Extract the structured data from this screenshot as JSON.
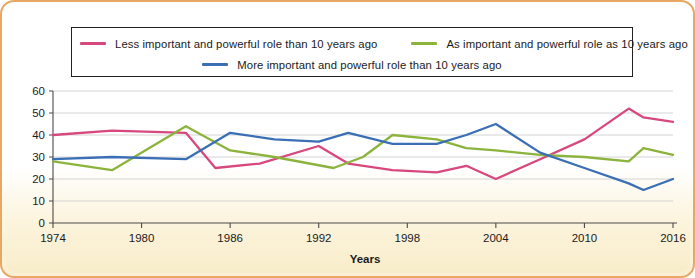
{
  "theme": {
    "border_color": "#e8a762",
    "panel_bg": "#ffffff",
    "grid_color": "#c9c9c9"
  },
  "legend": {
    "position": "top",
    "entries": [
      {
        "label": "Less important and powerful role than 10 years ago",
        "color": "#d6487e"
      },
      {
        "label": "As important and powerful role as 10 years ago",
        "color": "#8cb33c"
      },
      {
        "label": "More important and powerful role than 10 years ago",
        "color": "#3a6fb5"
      }
    ]
  },
  "chart_data": {
    "type": "line",
    "title": "",
    "xlabel": "Years",
    "ylabel": "",
    "xlim": [
      1974,
      2016
    ],
    "ylim": [
      0,
      60
    ],
    "ytick_step": 10,
    "yticks": [
      0,
      10,
      20,
      30,
      40,
      50,
      60
    ],
    "xticks": [
      1974,
      1980,
      1986,
      1992,
      1998,
      2004,
      2010,
      2016
    ],
    "grid": true,
    "series": [
      {
        "name": "Less important and powerful role than 10 years ago",
        "color": "#d6487e",
        "x": [
          1974,
          1978,
          1983,
          1985,
          1988,
          1992,
          1994,
          1997,
          2000,
          2002,
          2004,
          2007,
          2010,
          2013,
          2014,
          2016
        ],
        "values": [
          40,
          42,
          41,
          25,
          27,
          35,
          27,
          24,
          23,
          26,
          20,
          29,
          38,
          52,
          48,
          46
        ]
      },
      {
        "name": "As important and powerful role as 10 years ago",
        "color": "#8cb33c",
        "x": [
          1974,
          1978,
          1983,
          1986,
          1989,
          1993,
          1995,
          1997,
          2000,
          2002,
          2004,
          2007,
          2010,
          2013,
          2014,
          2016
        ],
        "values": [
          28,
          24,
          44,
          33,
          30,
          25,
          30,
          40,
          38,
          34,
          33,
          31,
          30,
          28,
          34,
          31
        ]
      },
      {
        "name": "More important and powerful role than 10 years ago",
        "color": "#3a6fb5",
        "x": [
          1974,
          1978,
          1983,
          1986,
          1989,
          1992,
          1994,
          1997,
          2000,
          2002,
          2004,
          2007,
          2010,
          2013,
          2014,
          2016
        ],
        "values": [
          29,
          30,
          29,
          41,
          38,
          37,
          41,
          36,
          36,
          40,
          45,
          32,
          25,
          18,
          15,
          20
        ]
      }
    ]
  }
}
